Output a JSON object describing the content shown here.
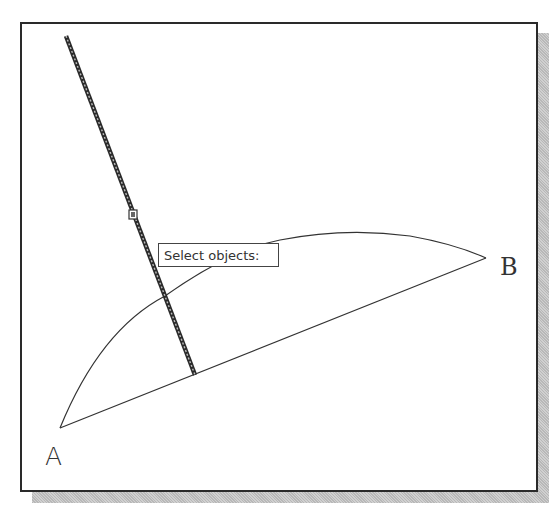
{
  "drawing": {
    "points": {
      "A": {
        "label": "A",
        "x": 60,
        "y": 428
      },
      "B": {
        "label": "B",
        "x": 486,
        "y": 258
      }
    },
    "arc": {
      "from": "A",
      "to": "B",
      "peak": {
        "x": 345,
        "y": 231
      }
    },
    "chord": {
      "from": "A",
      "to": "B"
    },
    "selected_line": {
      "x1": 66,
      "y1": 36,
      "x2": 195,
      "y2": 375,
      "state": "highlighted"
    },
    "grip_marker": {
      "x": 133,
      "y": 215
    }
  },
  "tooltip": {
    "text": "Select objects:"
  },
  "colors": {
    "line": "#333333",
    "frame": "#2a2a2a",
    "shadow": "#c4c4c4",
    "background": "#ffffff"
  }
}
